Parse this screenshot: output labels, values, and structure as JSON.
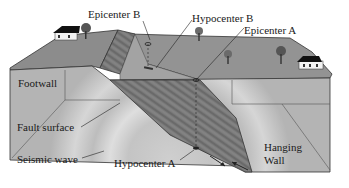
{
  "labels": {
    "epicenter_b": "Epicenter B",
    "hypocenter_b": "Hypocenter B",
    "epicenter_a": "Epicenter A",
    "footwall": "Footwall",
    "fault_surface": "Fault surface",
    "seismic_wave": "Seismic wave",
    "hypocenter_a": "Hypocenter A",
    "hanging_wall_line1": "Hanging",
    "hanging_wall_line2": "Wall"
  },
  "colors": {
    "background": "#ffffff",
    "top_surface": "#8e8e8e",
    "front_face": "#b9b9b9",
    "fault_plane": "#6e6e6e",
    "wave": "#d8d8d8",
    "line": "#222222"
  }
}
